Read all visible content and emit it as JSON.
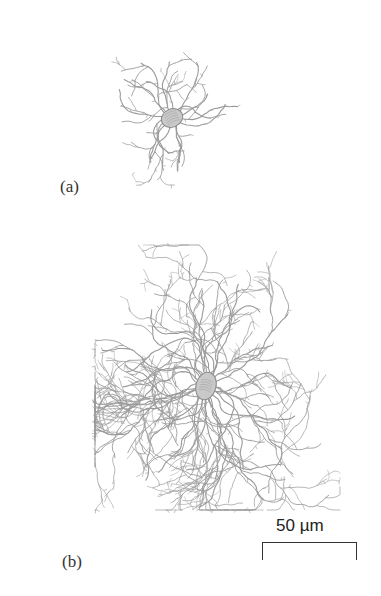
{
  "figure": {
    "panels": [
      {
        "label": "(a)",
        "soma": {
          "cx": 172,
          "cy": 118,
          "rx": 11,
          "ry": 9,
          "rotate": -25
        },
        "extent": {
          "x": [
            100,
            255
          ],
          "y": [
            35,
            185
          ]
        },
        "dendrites": {
          "count": 16,
          "length": 58,
          "seed": 7,
          "step": 4
        }
      },
      {
        "label": "(b)",
        "soma": {
          "cx": 206,
          "cy": 386,
          "rx": 10,
          "ry": 14,
          "rotate": 15
        },
        "extent": {
          "x": [
            95,
            340
          ],
          "y": [
            245,
            510
          ]
        },
        "dendrites": {
          "count": 30,
          "length": 120,
          "seed": 13,
          "step": 4
        }
      }
    ],
    "scale_bar": {
      "label": "50 µm",
      "length_px": 93
    },
    "colors": {
      "dendrite": "#9a9a9a",
      "soma": "#8a8a8a",
      "text": "#333333"
    }
  }
}
